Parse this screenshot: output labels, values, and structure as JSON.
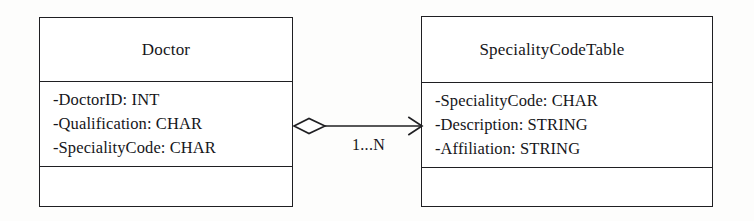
{
  "diagram": {
    "type": "uml-class-diagram",
    "background_color": "#fdfdfc",
    "line_color": "#1f1f22",
    "text_color": "#16161a"
  },
  "classes": [
    {
      "name": "Doctor",
      "attributes": [
        "-DoctorID: INT",
        "-Qualification: CHAR",
        "-SpecialityCode: CHAR"
      ],
      "operations": []
    },
    {
      "name": "SpecialityCodeTable",
      "attributes": [
        "-SpecialityCode: CHAR",
        "-Description: STRING",
        "-Affiliation: STRING"
      ],
      "operations": []
    }
  ],
  "association": {
    "source": "Doctor",
    "target": "SpecialityCodeTable",
    "source_decoration": "hollow-diamond",
    "target_decoration": "open-arrowhead",
    "multiplicity_label": "1...N"
  }
}
